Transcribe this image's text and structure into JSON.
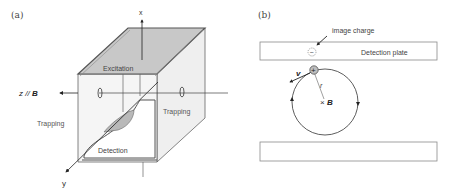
{
  "panel_a": {
    "label": "(a)",
    "axes": {
      "x": "x",
      "y": "y",
      "z": "z // B",
      "z_prefix": "z // ",
      "z_field": "B"
    },
    "electrodes": {
      "top": "Excitation",
      "left": "Trapping",
      "right": "Trapping",
      "bottom": "Detection"
    },
    "colors": {
      "excitation_fill": "#c8c8c8",
      "side_fill": "#efefef",
      "edge": "#555555",
      "detection_fill": "#b9b9b9"
    }
  },
  "panel_b": {
    "label": "(b)",
    "image_charge_label": "image charge",
    "image_charge_sign": "−",
    "detection_plate_label": "Detection plate",
    "ion_sign": "+",
    "velocity_label": "v",
    "radius_label": "r",
    "field_label": "B",
    "field_symbol": "×",
    "colors": {
      "plate_edge": "#888888",
      "orbit": "#333333",
      "ion_fill": "#bdbdbd"
    }
  }
}
